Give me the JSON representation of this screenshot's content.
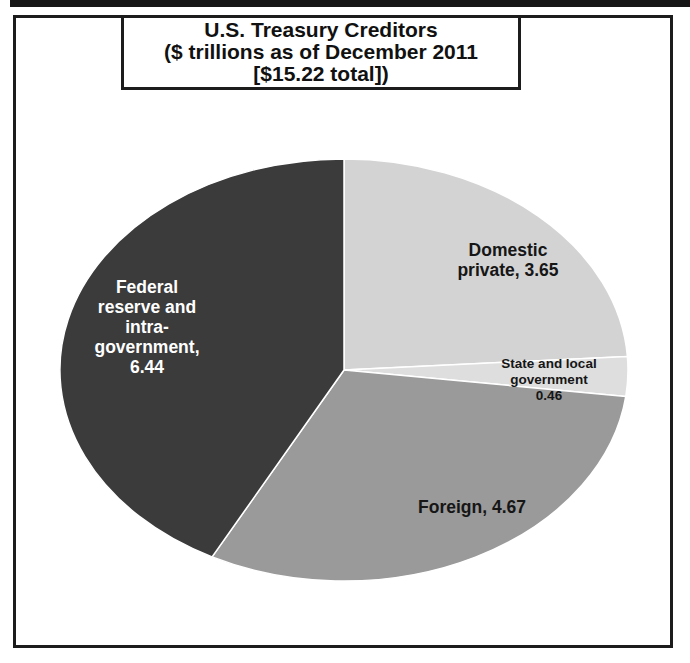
{
  "title": {
    "lines": [
      "U.S. Treasury Creditors",
      "($ trillions as of December 2011",
      "[$15.22 total])"
    ]
  },
  "chart_data": {
    "type": "pie",
    "title": "U.S. Treasury Creditors ($ trillions as of December 2011 [$15.22 total])",
    "units": "$ trillions",
    "total": 15.22,
    "start_angle_deg": 0,
    "direction": "clockwise",
    "slices": [
      {
        "label": "Domestic private",
        "value": 3.65,
        "color": "#d3d3d3",
        "label_color": "#161616",
        "label_lines": [
          "Domestic",
          "private, 3.65"
        ]
      },
      {
        "label": "State and local government",
        "value": 0.46,
        "color": "#dedede",
        "label_color": "#161616",
        "label_lines": [
          "State and local",
          "government",
          "0.46"
        ]
      },
      {
        "label": "Foreign",
        "value": 4.67,
        "color": "#9a9a9a",
        "label_color": "#161616",
        "label_lines": [
          "Foreign, 4.67"
        ]
      },
      {
        "label": "Federal reserve and intra-government",
        "value": 6.44,
        "color": "#3b3b3b",
        "label_color": "#ffffff",
        "label_lines": [
          "Federal",
          "reserve and",
          "intra-",
          "government,",
          "6.44"
        ]
      }
    ],
    "separator_color": "#ffffff"
  }
}
